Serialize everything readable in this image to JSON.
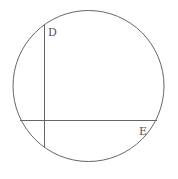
{
  "diagram": {
    "type": "circle-with-perpendicular-chords",
    "stroke_color": "#666666",
    "circle": {
      "cx": 88.5,
      "cy": 86,
      "r": 75.5
    },
    "chords": [
      {
        "name": "vertical-chord",
        "x1": 44.5,
        "y1": 24.5,
        "x2": 44.5,
        "y2": 147.5
      },
      {
        "name": "horizontal-chord",
        "x1": 20,
        "y1": 120.5,
        "x2": 157,
        "y2": 120.5
      }
    ],
    "labels": [
      {
        "text": "D",
        "x": 48,
        "y": 36
      },
      {
        "text": "E",
        "x": 139,
        "y": 135
      }
    ]
  }
}
